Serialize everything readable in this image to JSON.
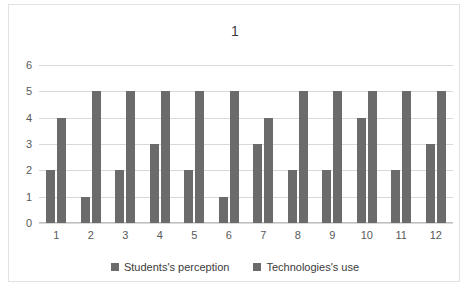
{
  "chart_data": {
    "type": "bar",
    "title": "1",
    "xlabel": "",
    "ylabel": "",
    "ylim": [
      0,
      6
    ],
    "ytick_step": 1,
    "yticks": [
      6,
      5,
      4,
      3,
      2,
      1,
      0
    ],
    "grid": true,
    "legend_position": "bottom-center",
    "categories": [
      "1",
      "2",
      "3",
      "4",
      "5",
      "6",
      "7",
      "8",
      "9",
      "10",
      "11",
      "12"
    ],
    "series": [
      {
        "name": "Students's perception",
        "color": "#6b6b6b",
        "values": [
          2,
          1,
          2,
          3,
          2,
          1,
          3,
          2,
          2,
          4,
          2,
          3
        ]
      },
      {
        "name": "Technologies's use",
        "color": "#6b6b6b",
        "values": [
          4,
          5,
          5,
          5,
          5,
          5,
          4,
          5,
          5,
          5,
          5,
          5
        ]
      }
    ]
  },
  "style": {
    "bar_color": "#6b6b6b",
    "grid_color": "#d9d9d9",
    "border_color": "#e2e2e2",
    "text_color": "#3b3b3b",
    "tick_color": "#595959",
    "background": "#ffffff"
  }
}
